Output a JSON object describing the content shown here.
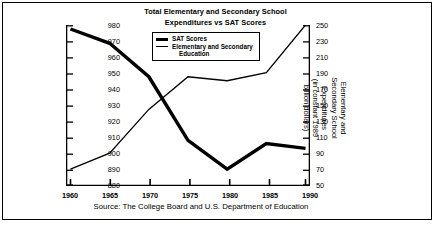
{
  "chart_data": {
    "type": "line",
    "title": "Total Elementary and Secondary School Expenditures vs SAT Scores",
    "title_line1": "Total Elementary and Secondary School",
    "title_line2": "Expenditures vs SAT Scores",
    "xlabel": "",
    "x": [
      1960,
      1965,
      1970,
      1975,
      1980,
      1985,
      1990
    ],
    "xlim": [
      1960,
      1990
    ],
    "xticks": [
      "1960",
      "1965",
      "1970",
      "1975",
      "1980",
      "1985",
      "1990"
    ],
    "grid": false,
    "legend_position": "top-center",
    "left_axis": {
      "label": "SAT Scores",
      "ylim": [
        880,
        980
      ],
      "ticks": [
        "980",
        "970",
        "960",
        "950",
        "940",
        "930",
        "920",
        "910",
        "900",
        "890",
        "880"
      ]
    },
    "right_axis": {
      "label": "Elementary and Secondary School Expenditures (in constant 1989 billion dollars)",
      "label_line1": "Elementary and",
      "label_line2": "Secondary School",
      "label_line3": "Expenditures",
      "label_line4": "(in constant 1989",
      "label_line5": "billion dollars)",
      "ylim": [
        50,
        250
      ],
      "ticks": [
        "250",
        "230",
        "210",
        "190",
        "170",
        "150",
        "130",
        "110",
        "90",
        "70",
        "50"
      ]
    },
    "series": [
      {
        "name": "SAT Scores",
        "axis": "left",
        "style": "thick",
        "color": "#000000",
        "values": [
          978,
          969,
          948,
          908,
          890,
          906,
          903
        ]
      },
      {
        "name": "Elementary and Secondary Education",
        "axis": "right",
        "style": "thin",
        "color": "#000000",
        "values": [
          70,
          90,
          145,
          186,
          181,
          191,
          251
        ]
      }
    ],
    "source": "Source: The College Board and U.S. Department of Education"
  },
  "legend": {
    "items": [
      {
        "label": "SAT Scores",
        "swatch": "thick"
      },
      {
        "label": "Elementary and Secondary",
        "label2": "Education",
        "swatch": "thin"
      }
    ]
  },
  "colors": {
    "ink": "#000000",
    "background": "#ffffff"
  }
}
